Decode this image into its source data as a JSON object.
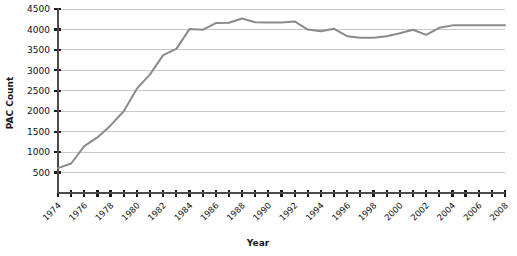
{
  "chart_data": {
    "type": "line",
    "title": "",
    "xlabel": "Year",
    "ylabel": "PAC Count",
    "grid": true,
    "legend": false,
    "line_color": "#8a8a8a",
    "axis_color": "#1a1a1a",
    "grid_color": "#c8c8c8",
    "plot_background": "#ffffff",
    "xlim": [
      1974,
      2008
    ],
    "ylim": [
      0,
      4500
    ],
    "yticks": [
      500,
      1000,
      1500,
      2000,
      2500,
      3000,
      3500,
      4000,
      4500
    ],
    "ytick_labels": [
      "500",
      "1000",
      "1500",
      "2000",
      "2500",
      "3000",
      "3500",
      "4000",
      "4500"
    ],
    "xticks": [
      1974,
      1975,
      1976,
      1977,
      1978,
      1979,
      1980,
      1981,
      1982,
      1983,
      1984,
      1985,
      1986,
      1987,
      1988,
      1989,
      1990,
      1991,
      1992,
      1993,
      1994,
      1995,
      1996,
      1997,
      1998,
      1999,
      2000,
      2001,
      2002,
      2003,
      2004,
      2005,
      2006,
      2007,
      2008
    ],
    "xtick_labels": [
      "1974",
      "1976",
      "1978",
      "1980",
      "1982",
      "1984",
      "1986",
      "1988",
      "1990",
      "1992",
      "1994",
      "1996",
      "1998",
      "2000",
      "2002",
      "2004",
      "2006",
      "2008"
    ],
    "xtick_label_years": [
      1974,
      1976,
      1978,
      1980,
      1982,
      1984,
      1986,
      1988,
      1990,
      1992,
      1994,
      1996,
      1998,
      2000,
      2002,
      2004,
      2006,
      2008
    ],
    "x": [
      1974,
      1975,
      1976,
      1977,
      1978,
      1979,
      1980,
      1981,
      1982,
      1983,
      1984,
      1985,
      1986,
      1987,
      1988,
      1989,
      1990,
      1991,
      1992,
      1993,
      1994,
      1995,
      1996,
      1997,
      1998,
      1999,
      2000,
      2001,
      2002,
      2003,
      2004,
      2005,
      2006,
      2007,
      2008
    ],
    "values": [
      608,
      722,
      1146,
      1360,
      1653,
      2000,
      2551,
      2901,
      3371,
      3525,
      4009,
      3992,
      4157,
      4165,
      4268,
      4178,
      4172,
      4172,
      4195,
      3996,
      3954,
      4016,
      3835,
      3798,
      3798,
      3835,
      3907,
      3992,
      3868,
      4040,
      4100,
      4100,
      4100,
      4100,
      4100
    ],
    "point_count": 35
  },
  "axes": {
    "y_axis_title": "PAC Count",
    "x_axis_title": "Year"
  }
}
